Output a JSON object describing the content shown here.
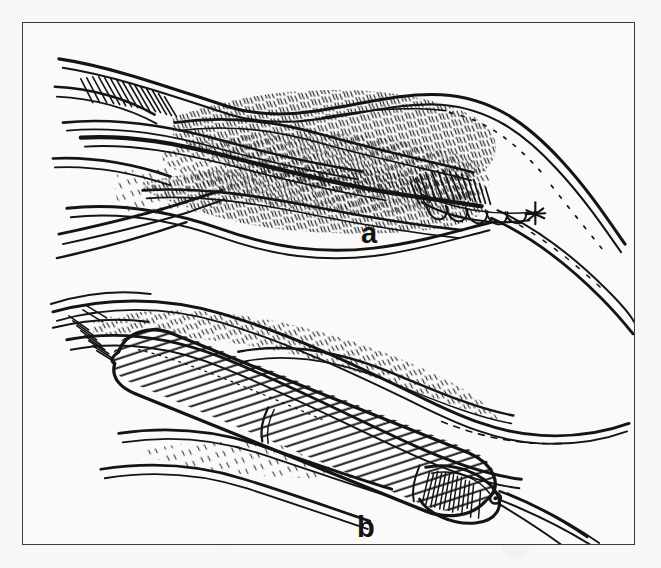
{
  "figure": {
    "kind": "medical-line-illustration",
    "technique": "pen-and-ink hatched drawing",
    "background_color": "#f8f7f5",
    "frame_color": "#3a3a40",
    "ink_color": "#141414",
    "panel_count": 2
  },
  "panels": [
    {
      "id": "a",
      "label": "a",
      "label_position": "bottom-center",
      "subject": "longitudinally opened blood vessel with running suture closure at the distal end",
      "elements": [
        "proximal vessel bifurcation with hatched wall",
        "opened vessel lumen with layered hatched walls",
        "running suture bite loops along distal edge",
        "suture knot at distal tip",
        "distal vessel outflow with dotted inner wall line"
      ]
    },
    {
      "id": "b",
      "label": "b",
      "label_position": "bottom-center",
      "subject": "tubular graft prosthesis seated within the vessel, ribbed corrugated surface, suture tails at distal tip",
      "elements": [
        "corrugated tubular graft with transverse ribbing",
        "rounded proximal graft tip",
        "bulbous distal graft tip",
        "suture knot with two free tails",
        "surrounding vessel wall with hatching",
        "lower vessel branch"
      ]
    }
  ],
  "labels": {
    "a": "a",
    "b": "b"
  }
}
